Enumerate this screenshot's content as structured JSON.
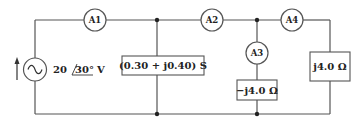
{
  "diagram": {
    "type": "ac-circuit",
    "source": {
      "label_mag": "20",
      "label_angle": "30°",
      "label_unit": "V",
      "symbol": "sine-wave-icon",
      "direction": "up-arrow-icon"
    },
    "ammeters": [
      {
        "id": "A1",
        "label": "A1"
      },
      {
        "id": "A2",
        "label": "A2"
      },
      {
        "id": "A3",
        "label": "A3"
      },
      {
        "id": "A4",
        "label": "A4"
      }
    ],
    "elements": [
      {
        "id": "Y1",
        "label": "(0.30 + j0.40) S",
        "type": "admittance"
      },
      {
        "id": "Z2",
        "label": "−j4.0 Ω",
        "type": "impedance"
      },
      {
        "id": "Z3",
        "label": "j4.0 Ω",
        "type": "impedance"
      }
    ],
    "colors": {
      "wire": "#555555",
      "text": "#222222",
      "background": "#ffffff"
    }
  }
}
